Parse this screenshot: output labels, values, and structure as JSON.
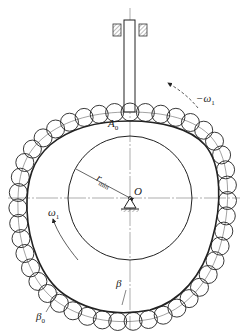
{
  "figure": {
    "type": "cam-mechanism-diagram",
    "colors": {
      "line": "#222222",
      "centerline": "#666666",
      "hatch": "#555555",
      "background": "#ffffff"
    },
    "geometry": {
      "center": [
        130,
        198
      ],
      "base_circle_radius": 62,
      "roller_radius": 9,
      "roller_count": 44
    }
  },
  "labels": {
    "A0": {
      "main": "A",
      "sub": "0"
    },
    "rmin": {
      "main": "r",
      "sub": "min"
    },
    "O": "O",
    "omega_ccw": {
      "main": "ω",
      "sub": "1"
    },
    "omega_cw": {
      "prefix": "−",
      "main": "ω",
      "sub": "1"
    },
    "beta": "β",
    "beta0": {
      "main": "β",
      "sub": "0"
    }
  }
}
